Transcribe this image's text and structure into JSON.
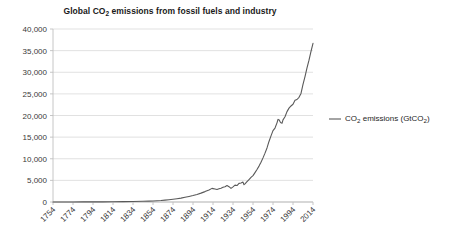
{
  "chart_data": {
    "type": "line",
    "title": "Global CO2 emissions from fossil fuels and industry",
    "title_parts": {
      "before": "Global CO",
      "sub": "2",
      "after": " emissions from fossil fuels and industry"
    },
    "xlabel": "",
    "ylabel": "",
    "ylim": [
      0,
      40000
    ],
    "xlim": [
      1754,
      2014
    ],
    "grid": true,
    "legend_position": "right",
    "legend": [
      {
        "name": "CO2 emissions (GtCO2)",
        "parts": {
          "p1": "CO",
          "s1": "2",
          "p2": " emissions (GtCO",
          "s2": "2",
          "p3": ")"
        },
        "color": "#595959"
      }
    ],
    "ytick_labels": [
      "40,000",
      "35,000",
      "30,000",
      "25,000",
      "20,000",
      "15,000",
      "10,000",
      "5,000",
      "0"
    ],
    "ytick_values": [
      40000,
      35000,
      30000,
      25000,
      20000,
      15000,
      10000,
      5000,
      0
    ],
    "xtick_labels": [
      "1754",
      "1774",
      "1794",
      "1814",
      "1834",
      "1854",
      "1874",
      "1894",
      "1914",
      "1934",
      "1954",
      "1974",
      "1994",
      "2014"
    ],
    "xtick_values": [
      1754,
      1774,
      1794,
      1814,
      1834,
      1854,
      1874,
      1894,
      1914,
      1934,
      1954,
      1974,
      1994,
      2014
    ],
    "series": [
      {
        "name": "CO2 emissions (GtCO2)",
        "color": "#595959",
        "x": [
          1754,
          1764,
          1774,
          1784,
          1794,
          1804,
          1814,
          1824,
          1834,
          1844,
          1850,
          1854,
          1858,
          1862,
          1866,
          1870,
          1874,
          1878,
          1882,
          1886,
          1890,
          1894,
          1898,
          1902,
          1906,
          1910,
          1913,
          1914,
          1916,
          1918,
          1920,
          1922,
          1924,
          1926,
          1928,
          1930,
          1932,
          1934,
          1936,
          1938,
          1940,
          1942,
          1944,
          1945,
          1946,
          1948,
          1950,
          1952,
          1954,
          1956,
          1958,
          1960,
          1962,
          1964,
          1966,
          1968,
          1970,
          1972,
          1974,
          1976,
          1978,
          1979,
          1980,
          1981,
          1982,
          1983,
          1984,
          1986,
          1988,
          1990,
          1992,
          1994,
          1996,
          1998,
          2000,
          2002,
          2004,
          2006,
          2008,
          2010,
          2012,
          2014
        ],
        "y": [
          10,
          12,
          15,
          20,
          28,
          40,
          55,
          80,
          120,
          180,
          210,
          240,
          290,
          350,
          430,
          530,
          640,
          760,
          900,
          1080,
          1280,
          1490,
          1750,
          2050,
          2400,
          2800,
          3150,
          3100,
          3000,
          2900,
          3050,
          3200,
          3400,
          3550,
          3800,
          3550,
          3150,
          3500,
          3900,
          3800,
          4300,
          4400,
          4600,
          4000,
          4200,
          4700,
          5200,
          5700,
          6100,
          6800,
          7500,
          8300,
          9200,
          10200,
          11300,
          12500,
          14000,
          15300,
          16500,
          17100,
          18300,
          19100,
          19000,
          18600,
          18300,
          18200,
          19000,
          19700,
          20900,
          21700,
          22200,
          22600,
          23500,
          23700,
          24200,
          25100,
          27200,
          29000,
          31000,
          32800,
          34800,
          36700
        ]
      }
    ]
  },
  "layout": {
    "plot_left": 53,
    "plot_right": 313,
    "plot_top": 29,
    "plot_bottom": 202,
    "legend_marker_x": 329,
    "legend_marker_width": 12,
    "legend_marker_y": 119,
    "legend_text_x": 345,
    "legend_text_y": 114
  },
  "colors": {
    "line": "#595959",
    "gridline": "#d9d9d9",
    "axis": "#bfbfbf",
    "text": "#3a3a3a",
    "background": "#ffffff"
  }
}
